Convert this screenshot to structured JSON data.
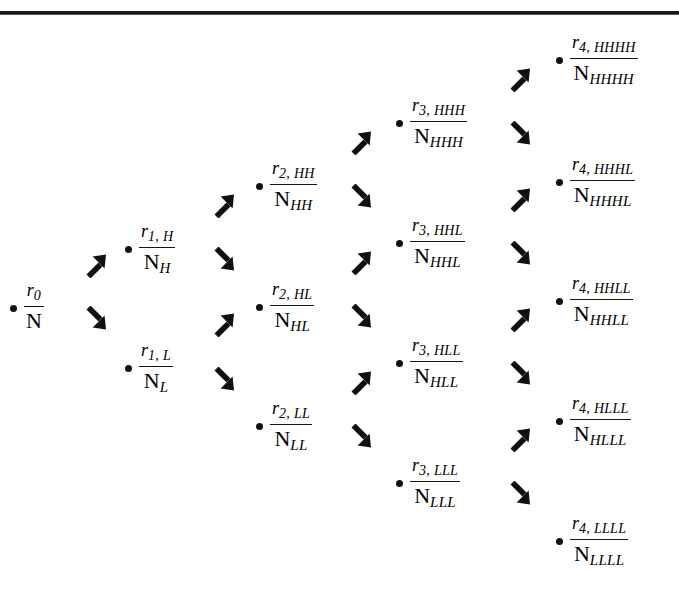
{
  "figure": {
    "type": "binomial-lattice-tree",
    "header_remnant": "",
    "levels": 5,
    "dot_color": "#111111",
    "arrow_color": "#101010",
    "rule_color": "#191919",
    "background": "#ffffff"
  },
  "nodes": [
    {
      "id": "root",
      "level": 0,
      "path": "",
      "num_var": "r",
      "num_sub": "0",
      "den_var": "N",
      "den_sub": "",
      "x": 10,
      "y": 281
    },
    {
      "id": "H",
      "level": 1,
      "path": "H",
      "num_var": "r",
      "num_sub": "1, H",
      "den_var": "N",
      "den_sub": "H",
      "x": 125,
      "y": 222
    },
    {
      "id": "L",
      "level": 1,
      "path": "L",
      "num_var": "r",
      "num_sub": "1, L",
      "den_var": "N",
      "den_sub": "L",
      "x": 125,
      "y": 341
    },
    {
      "id": "HH",
      "level": 2,
      "path": "HH",
      "num_var": "r",
      "num_sub": "2, HH",
      "den_var": "N",
      "den_sub": "HH",
      "x": 256,
      "y": 159
    },
    {
      "id": "HL",
      "level": 2,
      "path": "HL",
      "num_var": "r",
      "num_sub": "2, HL",
      "den_var": "N",
      "den_sub": "HL",
      "x": 256,
      "y": 280
    },
    {
      "id": "LL",
      "level": 2,
      "path": "LL",
      "num_var": "r",
      "num_sub": "2, LL",
      "den_var": "N",
      "den_sub": "LL",
      "x": 256,
      "y": 399
    },
    {
      "id": "HHH",
      "level": 3,
      "path": "HHH",
      "num_var": "r",
      "num_sub": "3, HHH",
      "den_var": "N",
      "den_sub": "HHH",
      "x": 396,
      "y": 96
    },
    {
      "id": "HHL",
      "level": 3,
      "path": "HHL",
      "num_var": "r",
      "num_sub": "3, HHL",
      "den_var": "N",
      "den_sub": "HHL",
      "x": 396,
      "y": 216
    },
    {
      "id": "HLL",
      "level": 3,
      "path": "HLL",
      "num_var": "r",
      "num_sub": "3, HLL",
      "den_var": "N",
      "den_sub": "HLL",
      "x": 396,
      "y": 336
    },
    {
      "id": "LLL",
      "level": 3,
      "path": "LLL",
      "num_var": "r",
      "num_sub": "3, LLL",
      "den_var": "N",
      "den_sub": "LLL",
      "x": 396,
      "y": 456
    },
    {
      "id": "HHHH",
      "level": 4,
      "path": "HHHH",
      "num_var": "r",
      "num_sub": "4, HHHH",
      "den_var": "N",
      "den_sub": "HHHH",
      "x": 556,
      "y": 33
    },
    {
      "id": "HHHL",
      "level": 4,
      "path": "HHHL",
      "num_var": "r",
      "num_sub": "4, HHHL",
      "den_var": "N",
      "den_sub": "HHHL",
      "x": 556,
      "y": 155
    },
    {
      "id": "HHLL",
      "level": 4,
      "path": "HHLL",
      "num_var": "r",
      "num_sub": "4, HHLL",
      "den_var": "N",
      "den_sub": "HHLL",
      "x": 556,
      "y": 274
    },
    {
      "id": "HLLL",
      "level": 4,
      "path": "HLLL",
      "num_var": "r",
      "num_sub": "4, HLLL",
      "den_var": "N",
      "den_sub": "HLLL",
      "x": 556,
      "y": 394
    },
    {
      "id": "LLLL",
      "level": 4,
      "path": "LLLL",
      "num_var": "r",
      "num_sub": "4, LLLL",
      "den_var": "N",
      "den_sub": "LLLL",
      "x": 556,
      "y": 514
    }
  ],
  "arrows": [
    {
      "id": "root-H",
      "dir": "up",
      "from": "root",
      "to": "H",
      "x": 83,
      "y": 252
    },
    {
      "id": "root-L",
      "dir": "down",
      "from": "root",
      "to": "L",
      "x": 83,
      "y": 306
    },
    {
      "id": "H-HH",
      "dir": "up",
      "from": "H",
      "to": "HH",
      "x": 211,
      "y": 192
    },
    {
      "id": "H-HL",
      "dir": "down",
      "from": "H",
      "to": "HL",
      "x": 211,
      "y": 247
    },
    {
      "id": "L-HL",
      "dir": "up",
      "from": "L",
      "to": "HL",
      "x": 211,
      "y": 311
    },
    {
      "id": "L-LL",
      "dir": "down",
      "from": "L",
      "to": "LL",
      "x": 211,
      "y": 367
    },
    {
      "id": "HH-HHH",
      "dir": "up",
      "from": "HH",
      "to": "HHH",
      "x": 348,
      "y": 129
    },
    {
      "id": "HH-HHL",
      "dir": "down",
      "from": "HH",
      "to": "HHL",
      "x": 348,
      "y": 184
    },
    {
      "id": "HL-HHL",
      "dir": "up",
      "from": "HL",
      "to": "HHL",
      "x": 348,
      "y": 249
    },
    {
      "id": "HL-HLL",
      "dir": "down",
      "from": "HL",
      "to": "HLL",
      "x": 348,
      "y": 304
    },
    {
      "id": "LL-HLL",
      "dir": "up",
      "from": "LL",
      "to": "HLL",
      "x": 348,
      "y": 369
    },
    {
      "id": "LL-LLL",
      "dir": "down",
      "from": "LL",
      "to": "LLL",
      "x": 348,
      "y": 424
    },
    {
      "id": "HHH-HHHH",
      "dir": "up",
      "from": "HHH",
      "to": "HHHH",
      "x": 507,
      "y": 66
    },
    {
      "id": "HHH-HHHL",
      "dir": "down",
      "from": "HHH",
      "to": "HHHL",
      "x": 507,
      "y": 121
    },
    {
      "id": "HHL-HHHL",
      "dir": "up",
      "from": "HHL",
      "to": "HHHL",
      "x": 507,
      "y": 186
    },
    {
      "id": "HHL-HHLL",
      "dir": "down",
      "from": "HHL",
      "to": "HHLL",
      "x": 507,
      "y": 241
    },
    {
      "id": "HLL-HHLL",
      "dir": "up",
      "from": "HLL",
      "to": "HHLL",
      "x": 507,
      "y": 306
    },
    {
      "id": "HLL-HLLL",
      "dir": "down",
      "from": "HLL",
      "to": "HLLL",
      "x": 507,
      "y": 361
    },
    {
      "id": "LLL-HLLL",
      "dir": "up",
      "from": "LLL",
      "to": "HLLL",
      "x": 507,
      "y": 426
    },
    {
      "id": "LLL-LLLL",
      "dir": "down",
      "from": "LLL",
      "to": "LLLL",
      "x": 507,
      "y": 481
    }
  ]
}
